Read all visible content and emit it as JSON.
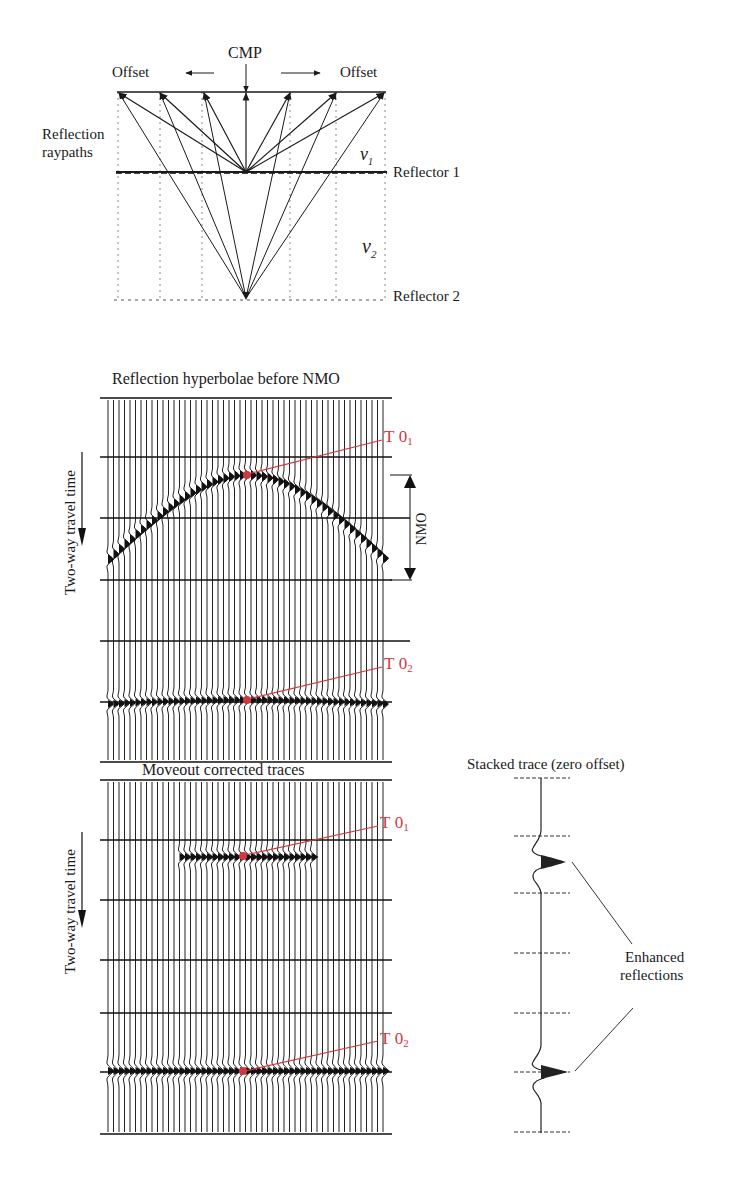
{
  "top_diagram": {
    "cmp_label": "CMP",
    "offset_left_label": "Offset",
    "offset_right_label": "Offset",
    "reflection_raypaths_label_line1": "Reflection",
    "reflection_raypaths_label_line2": "raypaths",
    "v1_label": "v",
    "v1_sub": "1",
    "v2_label": "v",
    "v2_sub": "2",
    "reflector1_label": "Reflector 1",
    "reflector2_label": "Reflector 2"
  },
  "panel_before_nmo": {
    "title": "Reflection hyperbolae before NMO",
    "y_axis_label": "Two-way travel time",
    "nmo_label": "NMO",
    "t01_label": "T",
    "t01_zero": "0",
    "t01_sub": "1",
    "t02_label": "T",
    "t02_zero": "0",
    "t02_sub": "2"
  },
  "panel_after_nmo": {
    "title": "Moveout corrected traces",
    "y_axis_label": "Two-way travel time",
    "t01_label": "T",
    "t01_zero": "0",
    "t01_sub": "1",
    "t02_label": "T",
    "t02_zero": "0",
    "t02_sub": "2"
  },
  "stacked_trace": {
    "title": "Stacked trace (zero offset)",
    "annotation_line1": "Enhanced",
    "annotation_line2": "reflections"
  },
  "colors": {
    "ink": "#1a1a1a",
    "marker_red": "#d0383f"
  }
}
